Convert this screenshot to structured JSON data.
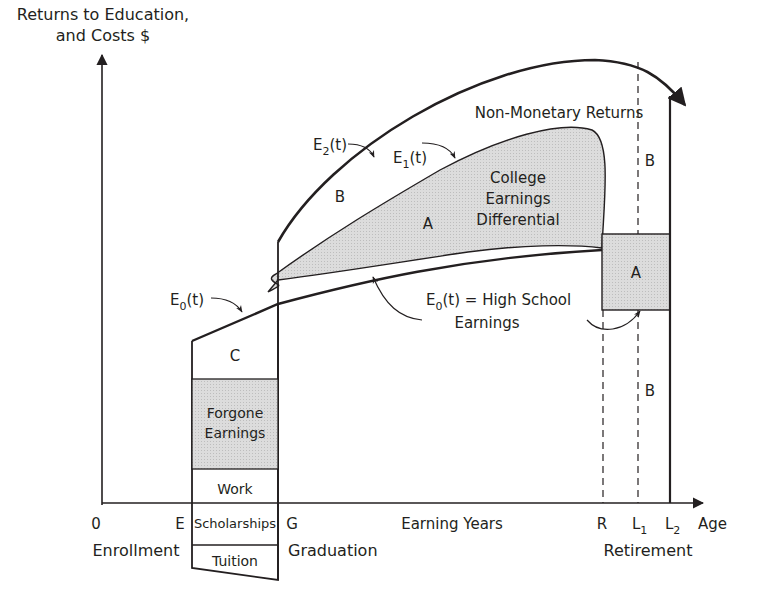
{
  "diagram": {
    "y_axis_label_line1": "Returns to Education,",
    "y_axis_label_line2": "and Costs $",
    "x_axis_end_label": "Age",
    "x_ticks": {
      "origin": "0",
      "enrollment_letter": "E",
      "graduation_letter": "G",
      "retirement_letter": "R",
      "l1_base": "L",
      "l1_sub": "1",
      "l2_base": "L",
      "l2_sub": "2"
    },
    "x_captions": {
      "enrollment": "Enrollment",
      "graduation": "Graduation",
      "earning_years": "Earning Years",
      "retirement": "Retirement"
    },
    "curves": {
      "e2": {
        "base": "E",
        "sub": "2",
        "tail": "(t)"
      },
      "e1": {
        "base": "E",
        "sub": "1",
        "tail": "(t)"
      },
      "e0": {
        "base": "E",
        "sub": "0",
        "tail": "(t)"
      },
      "e0_def": {
        "base": "E",
        "sub": "0",
        "tail": "(t) = High School",
        "line2": "Earnings"
      }
    },
    "regions": {
      "non_monetary": "Non-Monetary Returns",
      "b_upper": "B",
      "b_right_upper": "B",
      "b_right_lower": "B",
      "a_main": "A",
      "a_retire": "A",
      "college_diff_line1": "College",
      "college_diff_line2": "Earnings",
      "college_diff_line3": "Differential",
      "c": "C"
    },
    "cost_stack": {
      "forgone_line1": "Forgone",
      "forgone_line2": "Earnings",
      "work": "Work",
      "scholarships": "Scholarships",
      "tuition": "Tuition"
    },
    "colors": {
      "ink": "#231f20",
      "shade": "#d9d9d9"
    }
  }
}
